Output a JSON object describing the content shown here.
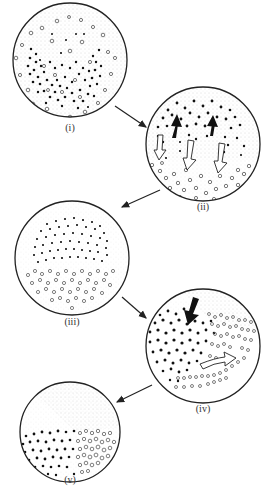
{
  "diagram": {
    "panels": [
      {
        "id": "i",
        "label": "(i)",
        "cx": 70,
        "cy": 60,
        "r": 57,
        "label_y": 122,
        "description": "mixed filled and open particles in stippled medium; filled particles concentrated in lower bowl shape"
      },
      {
        "id": "ii",
        "label": "(ii)",
        "cx": 203,
        "cy": 144,
        "r": 57,
        "label_y": 201,
        "description": "filled particles rise (black up arrows) while open particles sink (white down arrows)"
      },
      {
        "id": "iii",
        "label": "(iii)",
        "cx": 72,
        "cy": 258,
        "r": 57,
        "label_y": 316,
        "description": "filled particles in upper dome layer, open particles in bottom layer"
      },
      {
        "id": "iv",
        "label": "(iv)",
        "cx": 203,
        "cy": 346,
        "r": 57,
        "label_y": 403,
        "description": "black arrow pushes filled particles down; white curved arrow pushes open particles right"
      },
      {
        "id": "v",
        "label": "(v)",
        "cx": 70,
        "cy": 432,
        "r": 50,
        "label_y": 474,
        "description": "filled particles lower-left, open particles lower-right, stippled medium above"
      }
    ],
    "arrows": [
      {
        "from": "i",
        "to": "ii",
        "x1": 115,
        "y1": 106,
        "x2": 146,
        "y2": 127
      },
      {
        "from": "ii",
        "to": "iii",
        "x1": 160,
        "y1": 190,
        "x2": 122,
        "y2": 207
      },
      {
        "from": "iii",
        "to": "iv",
        "x1": 122,
        "y1": 297,
        "x2": 146,
        "y2": 318
      },
      {
        "from": "iv",
        "to": "v",
        "x1": 152,
        "y1": 385,
        "x2": 117,
        "y2": 402
      }
    ],
    "colors": {
      "outline": "#222222",
      "filled_particle": "#111111",
      "open_particle_stroke": "#555555",
      "stipple": "#b8b8b8",
      "background": "#ffffff"
    }
  }
}
